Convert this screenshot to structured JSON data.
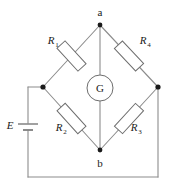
{
  "diagram": {
    "nodes": {
      "top_label": "a",
      "bottom_label": "b"
    },
    "source": {
      "label": "E",
      "symbol": "battery"
    },
    "meter": {
      "label": "G",
      "symbol": "galvanometer"
    },
    "resistors": [
      {
        "id": "R1",
        "label": "R",
        "sub": "1"
      },
      {
        "id": "R2",
        "label": "R",
        "sub": "2"
      },
      {
        "id": "R3",
        "label": "R",
        "sub": "3"
      },
      {
        "id": "R4",
        "label": "R",
        "sub": "4"
      }
    ],
    "colors": {
      "wire": "#8c8c8c",
      "component_outline": "#6e6e6e",
      "component_fill": "#ffffff",
      "node_dot": "#1a1a1a",
      "text": "#1a1a1a",
      "background": "#ffffff"
    }
  }
}
